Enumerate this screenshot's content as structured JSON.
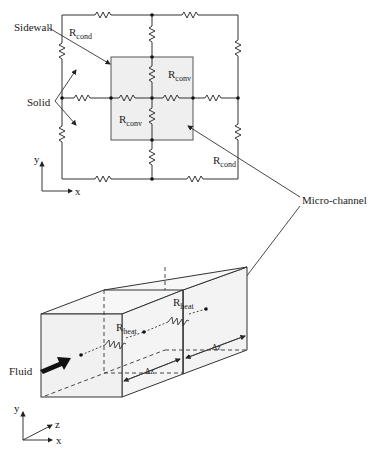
{
  "top_network": {
    "labels": {
      "sidewall": "Sidewall",
      "solid": "Solid",
      "r_cond_top": {
        "main": "R",
        "sub": "cond"
      },
      "r_cond_bottom": {
        "main": "R",
        "sub": "cond"
      },
      "r_conv_upper": {
        "main": "R",
        "sub": "conv"
      },
      "r_conv_lower": {
        "main": "R",
        "sub": "conv"
      }
    },
    "axes": {
      "y": "y",
      "x": "x"
    }
  },
  "callout": {
    "micro_channel": "Micro-channel"
  },
  "bottom_channel": {
    "labels": {
      "fluid": "Fluid",
      "r_heat_left": {
        "main": "R",
        "sub": "heat"
      },
      "r_heat_right": {
        "main": "R",
        "sub": "heat"
      },
      "dz_left": "Δz",
      "dz_right": "Δz"
    },
    "axes": {
      "y": "y",
      "z": "z",
      "x": "x"
    }
  },
  "colors": {
    "line": "#333333",
    "fill_gray": "#efefef",
    "text": "#222222"
  }
}
